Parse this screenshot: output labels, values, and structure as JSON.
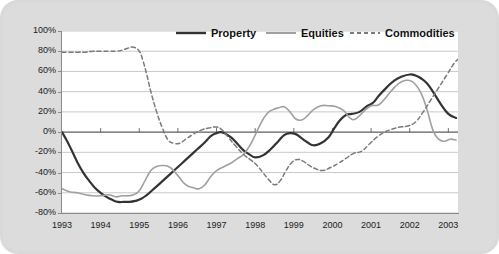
{
  "chart_data": {
    "type": "line",
    "title": "",
    "xlabel": "",
    "ylabel": "",
    "grid": true,
    "legend_position": "top-center",
    "xlim": [
      1993,
      2003.25
    ],
    "ylim": [
      -80,
      100
    ],
    "ytick_labels": [
      "100%",
      "80%",
      "60%",
      "40%",
      "20%",
      "0%",
      "-20%",
      "-40%",
      "-60%",
      "-80%"
    ],
    "ytick_values": [
      100,
      80,
      60,
      40,
      20,
      0,
      -20,
      -40,
      -60,
      -80
    ],
    "xtick_labels": [
      "1993",
      "1994",
      "1995",
      "1996",
      "1997",
      "1998",
      "1999",
      "2000",
      "2001",
      "2002",
      "2003"
    ],
    "xtick_values": [
      1993,
      1994,
      1995,
      1996,
      1997,
      1998,
      1999,
      2000,
      2001,
      2002,
      2003
    ],
    "series": [
      {
        "name": "Property",
        "color": "#333333",
        "style": "solid",
        "width": 2.2,
        "x": [
          1993.0,
          1993.12,
          1993.25,
          1993.4,
          1993.55,
          1993.7,
          1993.85,
          1994.0,
          1994.15,
          1994.3,
          1994.45,
          1994.6,
          1994.75,
          1994.9,
          1995.05,
          1995.2,
          1995.35,
          1995.5,
          1995.7,
          1995.9,
          1996.1,
          1996.3,
          1996.5,
          1996.7,
          1996.85,
          1997.0,
          1997.12,
          1997.25,
          1997.4,
          1997.55,
          1997.7,
          1997.85,
          1998.0,
          1998.2,
          1998.4,
          1998.6,
          1998.75,
          1998.9,
          1999.05,
          1999.2,
          1999.35,
          1999.5,
          1999.7,
          1999.9,
          2000.05,
          2000.2,
          2000.35,
          2000.5,
          2000.7,
          2000.9,
          2001.05,
          2001.2,
          2001.4,
          2001.6,
          2001.8,
          2002.0,
          2002.15,
          2002.3,
          2002.45,
          2002.6,
          2002.8,
          2003.0,
          2003.2
        ],
        "values": [
          0,
          -8,
          -18,
          -30,
          -40,
          -48,
          -55,
          -60,
          -64,
          -67,
          -69,
          -69,
          -69,
          -68,
          -66,
          -62,
          -57,
          -52,
          -45,
          -38,
          -31,
          -24,
          -17,
          -10,
          -4,
          -1,
          0,
          -2,
          -6,
          -12,
          -18,
          -22,
          -25,
          -23,
          -17,
          -9,
          -3,
          -1,
          -2,
          -6,
          -10,
          -13,
          -11,
          -5,
          4,
          12,
          17,
          18,
          20,
          26,
          29,
          36,
          44,
          51,
          55,
          57,
          56,
          53,
          48,
          40,
          28,
          18,
          14
        ]
      },
      {
        "name": "Equities",
        "color": "#a0a0a0",
        "style": "solid",
        "width": 1.6,
        "x": [
          1993.0,
          1993.2,
          1993.4,
          1993.6,
          1993.8,
          1994.0,
          1994.2,
          1994.4,
          1994.55,
          1994.7,
          1994.85,
          1995.0,
          1995.15,
          1995.3,
          1995.45,
          1995.6,
          1995.8,
          1996.0,
          1996.2,
          1996.4,
          1996.55,
          1996.7,
          1996.85,
          1997.0,
          1997.2,
          1997.4,
          1997.55,
          1997.7,
          1997.85,
          1998.0,
          1998.15,
          1998.3,
          1998.45,
          1998.6,
          1998.75,
          1998.9,
          1999.05,
          1999.2,
          1999.35,
          1999.5,
          1999.7,
          1999.9,
          2000.1,
          2000.3,
          2000.45,
          2000.6,
          2000.8,
          2001.0,
          2001.2,
          2001.4,
          2001.6,
          2001.8,
          2002.0,
          2002.15,
          2002.3,
          2002.45,
          2002.6,
          2002.75,
          2002.9,
          2003.05,
          2003.2
        ],
        "values": [
          -56,
          -59,
          -60,
          -62,
          -63,
          -63,
          -62,
          -64,
          -63,
          -63,
          -62,
          -58,
          -48,
          -38,
          -34,
          -33,
          -35,
          -43,
          -52,
          -55,
          -56,
          -52,
          -44,
          -38,
          -34,
          -30,
          -26,
          -22,
          -14,
          -3,
          9,
          18,
          22,
          24,
          25,
          20,
          13,
          12,
          16,
          22,
          26,
          26,
          25,
          21,
          14,
          13,
          20,
          26,
          27,
          35,
          44,
          50,
          51,
          47,
          38,
          22,
          2,
          -7,
          -9,
          -7,
          -8
        ]
      },
      {
        "name": "Commodities",
        "color": "#7a7a7a",
        "style": "dashed",
        "width": 1.5,
        "x": [
          1993.0,
          1993.2,
          1993.4,
          1993.6,
          1993.8,
          1994.0,
          1994.2,
          1994.4,
          1994.55,
          1994.7,
          1994.85,
          1995.0,
          1995.1,
          1995.2,
          1995.3,
          1995.45,
          1995.6,
          1995.75,
          1995.9,
          1996.05,
          1996.2,
          1996.4,
          1996.6,
          1996.8,
          1997.0,
          1997.15,
          1997.3,
          1997.5,
          1997.7,
          1997.9,
          1998.05,
          1998.2,
          1998.35,
          1998.5,
          1998.65,
          1998.8,
          1998.95,
          1999.1,
          1999.25,
          1999.4,
          1999.55,
          1999.75,
          1999.95,
          2000.15,
          2000.35,
          2000.55,
          2000.75,
          2000.95,
          2001.15,
          2001.35,
          2001.55,
          2001.75,
          2001.95,
          2002.15,
          2002.35,
          2002.55,
          2002.75,
          2002.95,
          2003.15,
          2003.25
        ],
        "values": [
          79,
          79,
          79,
          79,
          80,
          80,
          80,
          80,
          81,
          83,
          84,
          80,
          70,
          56,
          40,
          20,
          4,
          -8,
          -11,
          -11,
          -7,
          -2,
          2,
          4,
          5,
          2,
          -5,
          -14,
          -22,
          -28,
          -33,
          -40,
          -47,
          -52,
          -48,
          -38,
          -30,
          -27,
          -29,
          -33,
          -36,
          -38,
          -35,
          -31,
          -26,
          -21,
          -19,
          -12,
          -5,
          0,
          3,
          5,
          6,
          10,
          20,
          32,
          44,
          56,
          68,
          72
        ]
      }
    ]
  },
  "legend": {
    "items": [
      {
        "label": "Property"
      },
      {
        "label": "Equities"
      },
      {
        "label": "Commodities"
      }
    ]
  }
}
